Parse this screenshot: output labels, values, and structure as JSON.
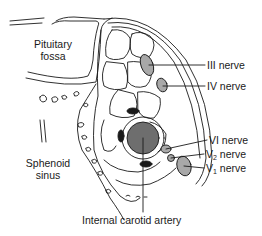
{
  "figure": {
    "labels": {
      "pituitary_line1": "Pituitary",
      "pituitary_line2": "fossa",
      "sphenoid_line1": "Sphenoid",
      "sphenoid_line2": "sinus",
      "nerve_iii": "III nerve",
      "nerve_iv": "IV nerve",
      "nerve_vi": "VI nerve",
      "nerve_v2_prefix": "V",
      "nerve_v2_sub": "2",
      "nerve_v2_suffix": " nerve",
      "nerve_v1_prefix": "V",
      "nerve_v1_sub": "1",
      "nerve_v1_suffix": " nerve",
      "carotid": "Internal carotid artery"
    },
    "colors": {
      "line": "#1a1a1a",
      "nerve_fill": "#a8a8a8",
      "artery_fill": "#6e6e6e",
      "background": "#ffffff"
    }
  }
}
